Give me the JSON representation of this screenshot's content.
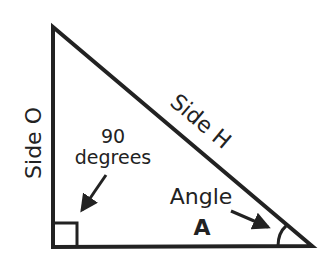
{
  "diagram": {
    "type": "right-triangle",
    "labels": {
      "side_o": "Side O",
      "side_h": "Side H",
      "right_angle_line1": "90",
      "right_angle_line2": "degrees",
      "angle_line1": "Angle",
      "angle_line2": "A"
    },
    "colors": {
      "stroke": "#222222",
      "background": "#ffffff"
    }
  }
}
